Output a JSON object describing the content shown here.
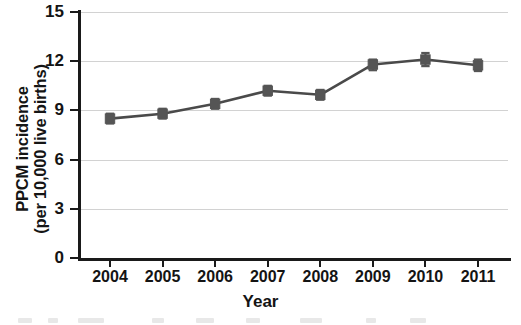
{
  "chart_data": {
    "type": "line",
    "title": "",
    "xlabel": "Year",
    "ylabel": "PPCM incidence (per 10,000 live births)",
    "ylabel_lines": [
      "PPCM incidence",
      "(per 10,000 live births)"
    ],
    "categories": [
      "2004",
      "2005",
      "2006",
      "2007",
      "2008",
      "2009",
      "2010",
      "2011"
    ],
    "values": [
      8.5,
      8.8,
      9.4,
      10.2,
      9.95,
      11.8,
      12.1,
      11.75
    ],
    "error_low": [
      8.2,
      8.5,
      9.1,
      9.9,
      9.65,
      11.45,
      11.7,
      11.4
    ],
    "error_high": [
      8.8,
      9.1,
      9.7,
      10.5,
      10.25,
      12.1,
      12.5,
      12.1
    ],
    "ylim": [
      0,
      15
    ],
    "yticks": [
      0,
      3,
      6,
      9,
      12,
      15
    ],
    "ytick_labels": [
      "0",
      "3",
      "6",
      "9",
      "12",
      "15"
    ],
    "xlim": [
      "2004",
      "2011"
    ],
    "grid": true,
    "grid_axis": "y",
    "legend": false,
    "legend_position": "none",
    "series_name": "PPCM incidence",
    "marker": "square",
    "error_bars": true
  },
  "colors": {
    "series": "#555555",
    "line": "#4a4a4a",
    "grid": "#d2d2d2",
    "axis": "#1a1a1a",
    "text": "#141414",
    "background": "#ffffff"
  }
}
